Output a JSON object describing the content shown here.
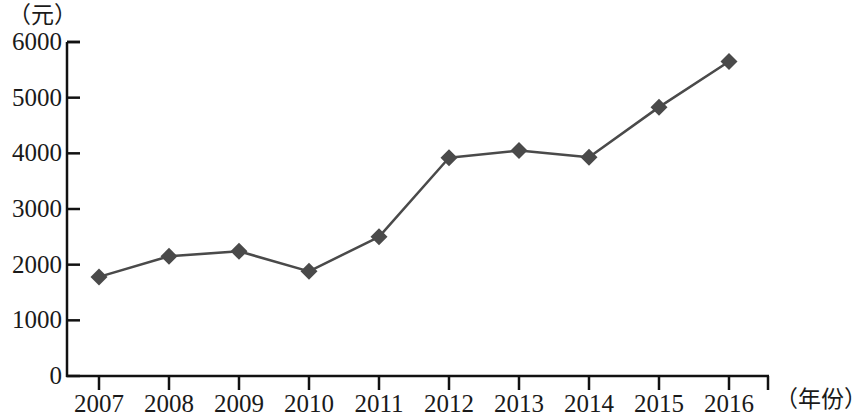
{
  "chart_data": {
    "type": "line",
    "title": "",
    "subtitle": "",
    "xlabel": "（年份）",
    "ylabel": "（元）",
    "categories": [
      "2007",
      "2008",
      "2009",
      "2010",
      "2011",
      "2012",
      "2013",
      "2014",
      "2015",
      "2016"
    ],
    "values": [
      1780,
      2150,
      2240,
      1880,
      2500,
      3920,
      4050,
      3930,
      4830,
      5650
    ],
    "series": [
      {
        "name": "",
        "values": [
          1780,
          2150,
          2240,
          1880,
          2500,
          3920,
          4050,
          3930,
          4830,
          5650
        ]
      }
    ],
    "ylim": [
      0,
      6000
    ],
    "yticks": [
      0,
      1000,
      2000,
      3000,
      4000,
      5000,
      6000
    ],
    "ytick_labels": [
      "0",
      "1000",
      "2000",
      "3000",
      "4000",
      "5000",
      "6000"
    ],
    "xtick_labels": [
      "2007",
      "2008",
      "2009",
      "2010",
      "2011",
      "2012",
      "2013",
      "2014",
      "2015",
      "2016"
    ],
    "grid": false,
    "legend": "none",
    "marker": "diamond",
    "line_color": "#4a4a4a",
    "marker_color": "#4a4a4a",
    "axis_color": "#111111",
    "background_color": "#ffffff"
  }
}
